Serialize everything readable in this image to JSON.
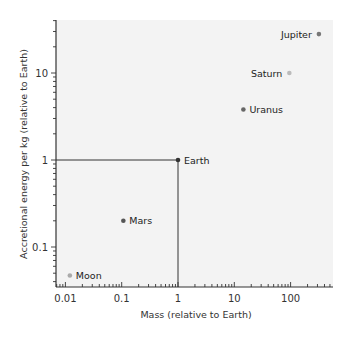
{
  "chart_data": {
    "type": "scatter",
    "title": "",
    "xlabel": "Mass (relative to Earth)",
    "ylabel": "Accretional energy per kg (relative to Earth)",
    "xscale": "log",
    "yscale": "log",
    "xlim": [
      0.007,
      500
    ],
    "ylim": [
      0.035,
      40
    ],
    "x_ticks": [
      0.01,
      0.1,
      1,
      10,
      100
    ],
    "x_tick_labels": [
      "0.01",
      "0.1",
      "1",
      "10",
      "100"
    ],
    "y_ticks": [
      0.1,
      1,
      10
    ],
    "y_tick_labels": [
      "0.1",
      "1",
      "10"
    ],
    "grid": false,
    "legend": null,
    "reference_lines": [
      {
        "type": "horizontal",
        "y": 1,
        "from_x": "axis",
        "to_x": 1
      },
      {
        "type": "vertical",
        "x": 1,
        "from_y": "axis",
        "to_y": 1
      }
    ],
    "points": [
      {
        "label": "Moon",
        "x": 0.012,
        "y": 0.047,
        "color": "#aaaaaa",
        "label_side": "right"
      },
      {
        "label": "Mars",
        "x": 0.107,
        "y": 0.2,
        "color": "#555555",
        "label_side": "right"
      },
      {
        "label": "Earth",
        "x": 1,
        "y": 1,
        "color": "#333333",
        "label_side": "right"
      },
      {
        "label": "Uranus",
        "x": 14.5,
        "y": 3.8,
        "color": "#666666",
        "label_side": "right"
      },
      {
        "label": "Saturn",
        "x": 95,
        "y": 10,
        "color": "#bbbbbb",
        "label_side": "left"
      },
      {
        "label": "Jupiter",
        "x": 318,
        "y": 28,
        "color": "#777777",
        "label_side": "left"
      }
    ]
  },
  "colors": {
    "plot_background": "#f3f3f3",
    "axis": "#333333",
    "reference_line": "#333333"
  }
}
